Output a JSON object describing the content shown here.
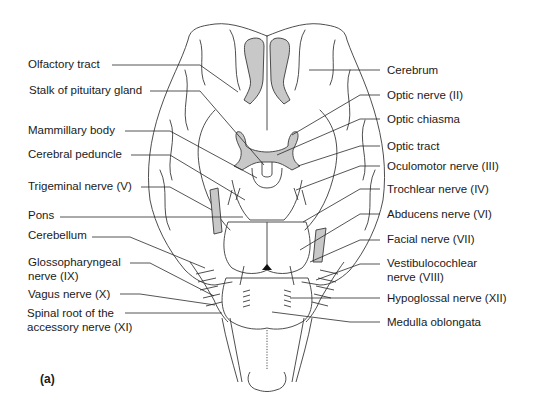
{
  "figure": {
    "panel_label": "(a)",
    "labels_left": [
      {
        "text": "Olfactory tract",
        "x": 28,
        "y": 58
      },
      {
        "text": "Stalk of pituitary gland",
        "x": 29,
        "y": 84
      },
      {
        "text": "Mammillary body",
        "x": 28,
        "y": 124
      },
      {
        "text": "Cerebral peduncle",
        "x": 28,
        "y": 148
      },
      {
        "text": "Trigeminal nerve (V)",
        "x": 28,
        "y": 180
      },
      {
        "text": "Pons",
        "x": 28,
        "y": 209
      },
      {
        "text": "Cerebellum",
        "x": 28,
        "y": 229
      },
      {
        "text": "Glossopharyngeal",
        "x": 28,
        "y": 256
      },
      {
        "text": "nerve (IX)",
        "x": 28,
        "y": 270
      },
      {
        "text": "Vagus nerve (X)",
        "x": 28,
        "y": 290
      },
      {
        "text": "Spinal root of the",
        "x": 27,
        "y": 312
      },
      {
        "text": "accessory nerve (XI)",
        "x": 27,
        "y": 326
      }
    ],
    "labels_right": [
      {
        "text": "Cerebrum",
        "x": 387,
        "y": 64
      },
      {
        "text": "Optic nerve (II)",
        "x": 387,
        "y": 89
      },
      {
        "text": "Optic chiasma",
        "x": 387,
        "y": 113
      },
      {
        "text": "Optic tract",
        "x": 387,
        "y": 140
      },
      {
        "text": "Oculomotor nerve (III)",
        "x": 387,
        "y": 160
      },
      {
        "text": "Trochlear nerve (IV)",
        "x": 387,
        "y": 183
      },
      {
        "text": "Abducens nerve (VI)",
        "x": 387,
        "y": 208
      },
      {
        "text": "Facial nerve (VII)",
        "x": 387,
        "y": 233
      },
      {
        "text": "Vestibulocochlear",
        "x": 387,
        "y": 257
      },
      {
        "text": "nerve (VIII)",
        "x": 387,
        "y": 271
      },
      {
        "text": "Hypoglossal nerve (XII)",
        "x": 387,
        "y": 292
      },
      {
        "text": "Medulla oblongata",
        "x": 387,
        "y": 316
      }
    ],
    "colors": {
      "outline": "#3a3a3a",
      "shade": "#c8c8c8",
      "text": "#1a1a1a",
      "background": "#ffffff"
    }
  }
}
